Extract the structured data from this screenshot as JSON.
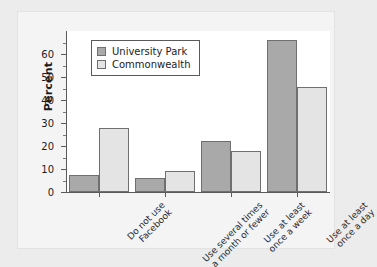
{
  "chart_data": {
    "type": "bar",
    "title": "",
    "xlabel": "",
    "ylabel": "Percent",
    "ylim": [
      0,
      70
    ],
    "ytick_step": 10,
    "yticks": [
      0,
      10,
      20,
      30,
      40,
      50,
      60
    ],
    "ytick_labels": [
      "0",
      "10",
      "20",
      "30",
      "40",
      "50",
      "60"
    ],
    "minor_tick_step": 5,
    "grid": false,
    "legend_position": "upper left",
    "categories": [
      "Do not use\nFacebook",
      "Use several times\na month or fewer",
      "Use at least\nonce a week",
      "Use at least\nonce a day"
    ],
    "series": [
      {
        "name": "University Park",
        "color": "#a9a9a9",
        "values": [
          7.5,
          6,
          22,
          66
        ]
      },
      {
        "name": "Commonwealth",
        "color": "#e4e4e4",
        "values": [
          28,
          9,
          18,
          45.5
        ]
      }
    ]
  },
  "figure": {
    "background_color": "#ececed",
    "panel_color": "#f4f4f4",
    "plot_background_color": "#ffffff",
    "axis_color": "#5a5a5a",
    "bar_edge_color": "#6f6f6f"
  }
}
